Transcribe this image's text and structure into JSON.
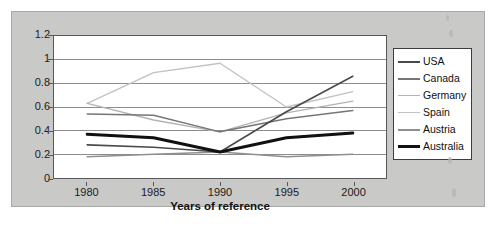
{
  "figure": {
    "background_color": "#c9c9c7",
    "plot_background_color": "#ffffff",
    "axis_color": "#58585a",
    "gridline_color": "#8c8c8e"
  },
  "chart_data": {
    "type": "line",
    "title": "",
    "xlabel": "Years of reference",
    "ylabel": "",
    "categories": [
      "1980",
      "1985",
      "1990",
      "1995",
      "2000"
    ],
    "x": [
      1980,
      1985,
      1990,
      1995,
      2000
    ],
    "xlim": [
      1977.5,
      2002.5
    ],
    "ylim": [
      0,
      1.2
    ],
    "yticks": [
      "0",
      "0.2",
      "0.4",
      "0.6",
      "0.8",
      "1",
      "1.2"
    ],
    "ytick_values": [
      0,
      0.2,
      0.4,
      0.6,
      0.8,
      1,
      1.2
    ],
    "grid": "horizontal",
    "legend_position": "right-outside",
    "series": [
      {
        "name": "USA",
        "values": [
          0.28,
          0.26,
          0.22,
          0.56,
          0.86
        ],
        "color": "#4a4a4c",
        "width": 1.6
      },
      {
        "name": "Canada",
        "values": [
          0.54,
          0.53,
          0.39,
          0.5,
          0.57
        ],
        "color": "#76767a",
        "width": 1.5
      },
      {
        "name": "Germany",
        "values": [
          0.63,
          0.49,
          0.39,
          0.55,
          0.65
        ],
        "color": "#b3b3b5",
        "width": 1.4
      },
      {
        "name": "Spain",
        "values": [
          0.63,
          0.89,
          0.97,
          0.6,
          0.73
        ],
        "color": "#c2c2c4",
        "width": 1.4
      },
      {
        "name": "Austria",
        "values": [
          0.18,
          0.2,
          0.22,
          0.18,
          0.2
        ],
        "color": "#8f8f93",
        "width": 1.5
      },
      {
        "name": "Australia",
        "values": [
          0.37,
          0.34,
          0.22,
          0.34,
          0.38
        ],
        "color": "#111111",
        "width": 3.0
      }
    ]
  }
}
